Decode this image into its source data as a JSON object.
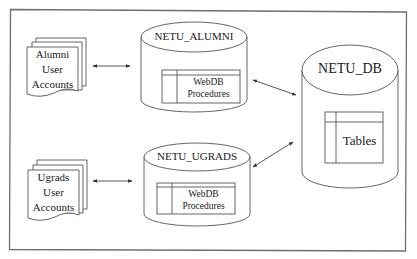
{
  "diagram": {
    "type": "architecture",
    "frame": {
      "color": "#6e6e6e"
    },
    "line_color": "#4a4a4a",
    "nodes": {
      "alumni_accounts": {
        "shape": "document-stack",
        "lines": [
          "Alumni",
          "User",
          "Accounts"
        ]
      },
      "ugrads_accounts": {
        "shape": "document-stack",
        "lines": [
          "Ugrads",
          "User",
          "Accounts"
        ]
      },
      "netu_alumni": {
        "shape": "cylinder",
        "title": "NETU_ALUMNI",
        "inner": {
          "shape": "table",
          "lines": [
            "WebDB",
            "Procedures"
          ]
        }
      },
      "netu_ugrads": {
        "shape": "cylinder",
        "title": "NETU_UGRADS",
        "inner": {
          "shape": "table",
          "lines": [
            "WebDB",
            "Procedures"
          ]
        }
      },
      "netu_db": {
        "shape": "cylinder",
        "title": "NETU_DB",
        "inner": {
          "shape": "table",
          "label": "Tables"
        }
      }
    },
    "edges": [
      {
        "from": "alumni_accounts",
        "to": "netu_alumni",
        "style": "bidirectional"
      },
      {
        "from": "ugrads_accounts",
        "to": "netu_ugrads",
        "style": "bidirectional"
      },
      {
        "from": "netu_alumni",
        "to": "netu_db",
        "style": "bidirectional"
      },
      {
        "from": "netu_ugrads",
        "to": "netu_db",
        "style": "bidirectional"
      }
    ]
  }
}
